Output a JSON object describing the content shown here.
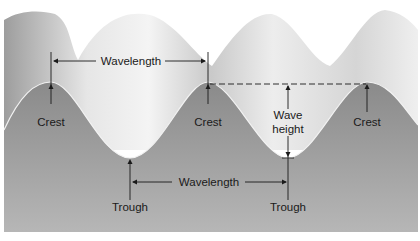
{
  "diagram": {
    "labels": {
      "wavelength_top": "Wavelength",
      "wavelength_bottom": "Wavelength",
      "crest_1": "Crest",
      "crest_2": "Crest",
      "crest_3": "Crest",
      "wave_height_line1": "Wave",
      "wave_height_line2": "height",
      "trough_1": "Trough",
      "trough_2": "Trough"
    },
    "colors": {
      "water_body": "#8f8f8f",
      "wave_surface_light": "#eeeeee",
      "wave_surface_dark": "#a8a8a8",
      "profile_line": "#f2f2f2",
      "annotation": "#1a1a1a"
    }
  }
}
